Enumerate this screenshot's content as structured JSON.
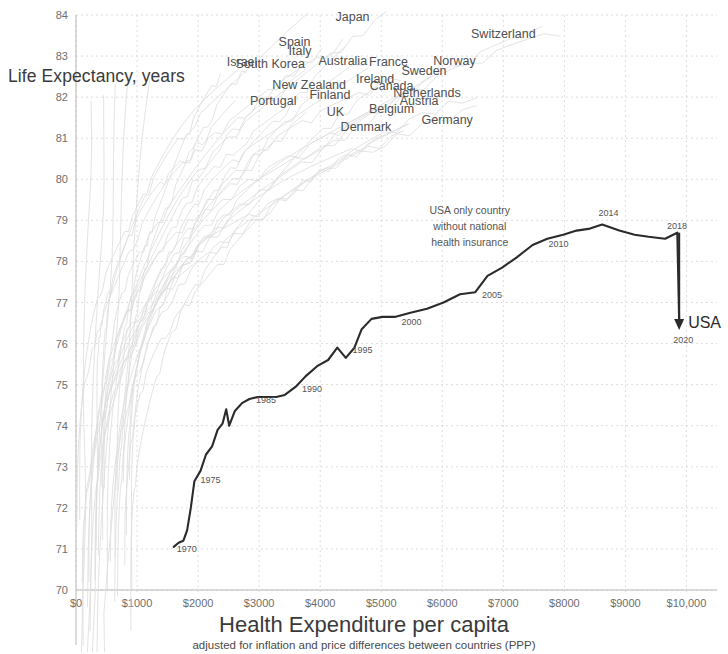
{
  "titles": {
    "y_axis": "Life Expectancy, years",
    "x_axis": "Health Expenditure per capita",
    "x_axis_sub": "adjusted for inflation and price differences between countries (PPP)"
  },
  "annotation": {
    "line1": "USA only country",
    "line2": "without national",
    "line3": "health insurance"
  },
  "usa_marker": {
    "label": "USA",
    "year": "2020"
  },
  "chart_data": {
    "type": "line",
    "title": "",
    "xlabel": "Health Expenditure per capita",
    "ylabel": "Life Expectancy, years",
    "xlim": [
      0,
      10500
    ],
    "ylim": [
      70,
      84
    ],
    "grid": true,
    "legend": "none (direct country labels)",
    "x_ticks": [
      0,
      1000,
      2000,
      3000,
      4000,
      5000,
      6000,
      7000,
      8000,
      9000,
      10000
    ],
    "x_tick_labels": [
      "$0",
      "$1000",
      "$2000",
      "$3000",
      "$4000",
      "$5000",
      "$6000",
      "$7000",
      "$8000",
      "$9000",
      "$10,000"
    ],
    "y_ticks": [
      70,
      71,
      72,
      73,
      74,
      75,
      76,
      77,
      78,
      79,
      80,
      81,
      82,
      83,
      84
    ],
    "y_tick_labels": [
      "70",
      "71",
      "72",
      "73",
      "74",
      "75",
      "76",
      "77",
      "78",
      "79",
      "80",
      "81",
      "82",
      "83",
      "84"
    ],
    "highlight_series": {
      "name": "USA",
      "color": "#2b2b2b",
      "points": [
        {
          "year": 1970,
          "x": 1600,
          "y": 71.05
        },
        {
          "year": 1971,
          "x": 1680,
          "y": 71.15
        },
        {
          "year": 1972,
          "x": 1760,
          "y": 71.2
        },
        {
          "year": 1973,
          "x": 1820,
          "y": 71.45
        },
        {
          "year": 1974,
          "x": 1880,
          "y": 72.0
        },
        {
          "year": 1975,
          "x": 1940,
          "y": 72.65
        },
        {
          "year": 1976,
          "x": 2040,
          "y": 72.9
        },
        {
          "year": 1977,
          "x": 2130,
          "y": 73.3
        },
        {
          "year": 1978,
          "x": 2230,
          "y": 73.5
        },
        {
          "year": 1979,
          "x": 2320,
          "y": 73.9
        },
        {
          "year": 1980,
          "x": 2400,
          "y": 74.05
        },
        {
          "year": 1981,
          "x": 2460,
          "y": 74.4
        },
        {
          "year": 1982,
          "x": 2510,
          "y": 74.0
        },
        {
          "year": 1983,
          "x": 2600,
          "y": 74.35
        },
        {
          "year": 1984,
          "x": 2720,
          "y": 74.55
        },
        {
          "year": 1985,
          "x": 2840,
          "y": 74.65
        },
        {
          "year": 1986,
          "x": 2980,
          "y": 74.7
        },
        {
          "year": 1987,
          "x": 3130,
          "y": 74.7
        },
        {
          "year": 1988,
          "x": 3280,
          "y": 74.7
        },
        {
          "year": 1989,
          "x": 3420,
          "y": 74.75
        },
        {
          "year": 1990,
          "x": 3600,
          "y": 74.95
        },
        {
          "year": 1991,
          "x": 3760,
          "y": 75.2
        },
        {
          "year": 1992,
          "x": 3950,
          "y": 75.45
        },
        {
          "year": 1993,
          "x": 4130,
          "y": 75.6
        },
        {
          "year": 1994,
          "x": 4280,
          "y": 75.9
        },
        {
          "year": 1995,
          "x": 4420,
          "y": 75.65
        },
        {
          "year": 1996,
          "x": 4560,
          "y": 75.9
        },
        {
          "year": 1997,
          "x": 4680,
          "y": 76.35
        },
        {
          "year": 1998,
          "x": 4840,
          "y": 76.6
        },
        {
          "year": 1999,
          "x": 5020,
          "y": 76.65
        },
        {
          "year": 2000,
          "x": 5220,
          "y": 76.65
        },
        {
          "year": 2001,
          "x": 5480,
          "y": 76.75
        },
        {
          "year": 2002,
          "x": 5750,
          "y": 76.85
        },
        {
          "year": 2003,
          "x": 6020,
          "y": 77.0
        },
        {
          "year": 2004,
          "x": 6290,
          "y": 77.2
        },
        {
          "year": 2005,
          "x": 6540,
          "y": 77.25
        },
        {
          "year": 2006,
          "x": 6740,
          "y": 77.65
        },
        {
          "year": 2007,
          "x": 6980,
          "y": 77.85
        },
        {
          "year": 2008,
          "x": 7220,
          "y": 78.1
        },
        {
          "year": 2009,
          "x": 7480,
          "y": 78.4
        },
        {
          "year": 2010,
          "x": 7720,
          "y": 78.55
        },
        {
          "year": 2011,
          "x": 7980,
          "y": 78.65
        },
        {
          "year": 2012,
          "x": 8200,
          "y": 78.75
        },
        {
          "year": 2013,
          "x": 8420,
          "y": 78.8
        },
        {
          "year": 2014,
          "x": 8620,
          "y": 78.9
        },
        {
          "year": 2015,
          "x": 8900,
          "y": 78.75
        },
        {
          "year": 2016,
          "x": 9150,
          "y": 78.65
        },
        {
          "year": 2017,
          "x": 9380,
          "y": 78.6
        },
        {
          "year": 2018,
          "x": 9650,
          "y": 78.55
        },
        {
          "year": 2019,
          "x": 9850,
          "y": 78.7
        },
        {
          "year": 2020,
          "x": 9880,
          "y": 76.5
        }
      ],
      "year_markers": [
        {
          "label": "1970",
          "x": 1650,
          "y": 70.92
        },
        {
          "label": "1975",
          "x": 2040,
          "y": 72.6
        },
        {
          "label": "1985",
          "x": 2950,
          "y": 74.55
        },
        {
          "label": "1990",
          "x": 3700,
          "y": 74.82
        },
        {
          "label": "1995",
          "x": 4530,
          "y": 75.78
        },
        {
          "label": "2000",
          "x": 5330,
          "y": 76.45
        },
        {
          "label": "2005",
          "x": 6650,
          "y": 77.1
        },
        {
          "label": "2010",
          "x": 7740,
          "y": 78.35
        },
        {
          "label": "2014",
          "x": 8560,
          "y": 79.1
        },
        {
          "label": "2018",
          "x": 9680,
          "y": 78.8
        }
      ]
    },
    "country_labels": [
      {
        "name": "Japan",
        "x": 4530,
        "y": 83.85
      },
      {
        "name": "Switzerland",
        "x": 7000,
        "y": 83.45
      },
      {
        "name": "Spain",
        "x": 3580,
        "y": 83.25
      },
      {
        "name": "Italy",
        "x": 3670,
        "y": 83.02
      },
      {
        "name": "Israel",
        "x": 2720,
        "y": 82.75
      },
      {
        "name": "South Korea",
        "x": 3180,
        "y": 82.72
      },
      {
        "name": "Australia",
        "x": 4370,
        "y": 82.78
      },
      {
        "name": "France",
        "x": 5120,
        "y": 82.75
      },
      {
        "name": "Norway",
        "x": 6200,
        "y": 82.78
      },
      {
        "name": "Sweden",
        "x": 5700,
        "y": 82.55
      },
      {
        "name": "Ireland",
        "x": 4900,
        "y": 82.35
      },
      {
        "name": "New Zealand",
        "x": 3820,
        "y": 82.2
      },
      {
        "name": "Canada",
        "x": 5170,
        "y": 82.18
      },
      {
        "name": "Netherlands",
        "x": 5750,
        "y": 82.0
      },
      {
        "name": "Finland",
        "x": 4160,
        "y": 81.95
      },
      {
        "name": "Portugal",
        "x": 3230,
        "y": 81.82
      },
      {
        "name": "Austria",
        "x": 5620,
        "y": 81.82
      },
      {
        "name": "Belgium",
        "x": 5170,
        "y": 81.62
      },
      {
        "name": "UK",
        "x": 4250,
        "y": 81.55
      },
      {
        "name": "Germany",
        "x": 6080,
        "y": 81.35
      },
      {
        "name": "Denmark",
        "x": 4750,
        "y": 81.18
      }
    ],
    "background_series_note": "faint light-grey trajectories for ~20 OECD countries, all rising steeply from low expenditure at left toward 80-84 years"
  }
}
